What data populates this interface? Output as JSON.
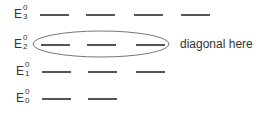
{
  "diagram": {
    "levels": [
      {
        "base": "E",
        "sup": "0",
        "sub": "3",
        "y": 14,
        "segments": [
          [
            40,
            69
          ],
          [
            86,
            115
          ],
          [
            134,
            163
          ],
          [
            181,
            210
          ]
        ]
      },
      {
        "base": "E",
        "sup": "0",
        "sub": "2",
        "y": 44,
        "segments": [
          [
            41,
            70
          ],
          [
            87,
            116
          ],
          [
            136,
            165
          ]
        ]
      },
      {
        "base": "E",
        "sup": "0",
        "sub": "1",
        "y": 71,
        "segments": [
          [
            42,
            71
          ],
          [
            88,
            117
          ],
          [
            136,
            165
          ]
        ]
      },
      {
        "base": "E",
        "sup": "0",
        "sub": "0",
        "y": 98,
        "segments": [
          [
            42,
            71
          ],
          [
            88,
            117
          ]
        ]
      }
    ],
    "highlight_ellipse": {
      "cx": 101,
      "cy": 44,
      "rx": 68,
      "ry": 13,
      "color": "#777777"
    },
    "annotation": "diagonal here",
    "line_color": "#555555"
  }
}
